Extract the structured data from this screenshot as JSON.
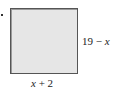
{
  "diagram": {
    "shape": "square",
    "fill_color": "#e6e6e6",
    "border_color": "#555555",
    "side_label_right": {
      "number": "19",
      "operator": "−",
      "variable": "x"
    },
    "side_label_bottom": {
      "variable": "x",
      "operator": "+",
      "number": "2"
    }
  }
}
